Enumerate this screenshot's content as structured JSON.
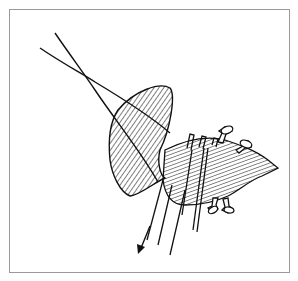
{
  "figure": {
    "type": "line-drawing illustration",
    "frame_color": "#9a9a9a",
    "ink_color": "#111111",
    "elements": [
      {
        "name": "suture-threads",
        "description": "two crossing thread lines from upper-left"
      },
      {
        "name": "dome-cap",
        "description": "hatched mushroom-shaped cap"
      },
      {
        "name": "vessel",
        "description": "hatched tubular structure extending to lower-right with stubby branch knobs"
      },
      {
        "name": "ligature-rings",
        "description": "three parallel bands around the vessel"
      },
      {
        "name": "pull-arrow",
        "description": "arrow pointing down-left indicating traction"
      }
    ]
  }
}
